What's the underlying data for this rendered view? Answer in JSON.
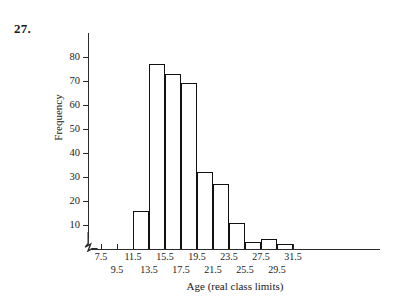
{
  "problem": {
    "number": "27."
  },
  "chart_data": {
    "type": "bar",
    "title": "",
    "subtitle": "",
    "xlabel": "Age (real class limits)",
    "ylabel": "Frequency",
    "grid": false,
    "legend": null,
    "xlim": [
      7.5,
      33.5
    ],
    "ylim": [
      0,
      80
    ],
    "y_ticks": [
      10,
      20,
      30,
      40,
      50,
      60,
      70,
      80
    ],
    "x_ticks": [
      7.5,
      9.5,
      11.5,
      13.5,
      15.5,
      17.5,
      19.5,
      21.5,
      23.5,
      25.5,
      27.5,
      29.5,
      31.5
    ],
    "x_tick_rows": {
      "top": [
        7.5,
        11.5,
        15.5,
        19.5,
        23.5,
        27.5,
        31.5
      ],
      "bottom": [
        9.5,
        13.5,
        17.5,
        21.5,
        25.5,
        29.5
      ]
    },
    "axis_break": "y-axis break at origin",
    "bin_width": 2,
    "bins": [
      {
        "left": 11.5,
        "right": 13.5,
        "value": 16
      },
      {
        "left": 13.5,
        "right": 15.5,
        "value": 77
      },
      {
        "left": 15.5,
        "right": 17.5,
        "value": 73
      },
      {
        "left": 17.5,
        "right": 19.5,
        "value": 69
      },
      {
        "left": 19.5,
        "right": 21.5,
        "value": 32
      },
      {
        "left": 21.5,
        "right": 23.5,
        "value": 27
      },
      {
        "left": 23.5,
        "right": 25.5,
        "value": 11
      },
      {
        "left": 25.5,
        "right": 27.5,
        "value": 3
      },
      {
        "left": 27.5,
        "right": 29.5,
        "value": 4
      },
      {
        "left": 29.5,
        "right": 31.5,
        "value": 2
      }
    ],
    "categories": [
      "11.5-13.5",
      "13.5-15.5",
      "15.5-17.5",
      "17.5-19.5",
      "19.5-21.5",
      "21.5-23.5",
      "23.5-25.5",
      "25.5-27.5",
      "27.5-29.5",
      "29.5-31.5"
    ],
    "values": [
      16,
      77,
      73,
      69,
      32,
      27,
      11,
      3,
      4,
      2
    ],
    "colors": {
      "bar_outline": "#111111",
      "bar_fill": "#ffffff",
      "axis": "#2a2a2a",
      "text": "#1a1a1a",
      "background": "#ffffff"
    }
  }
}
